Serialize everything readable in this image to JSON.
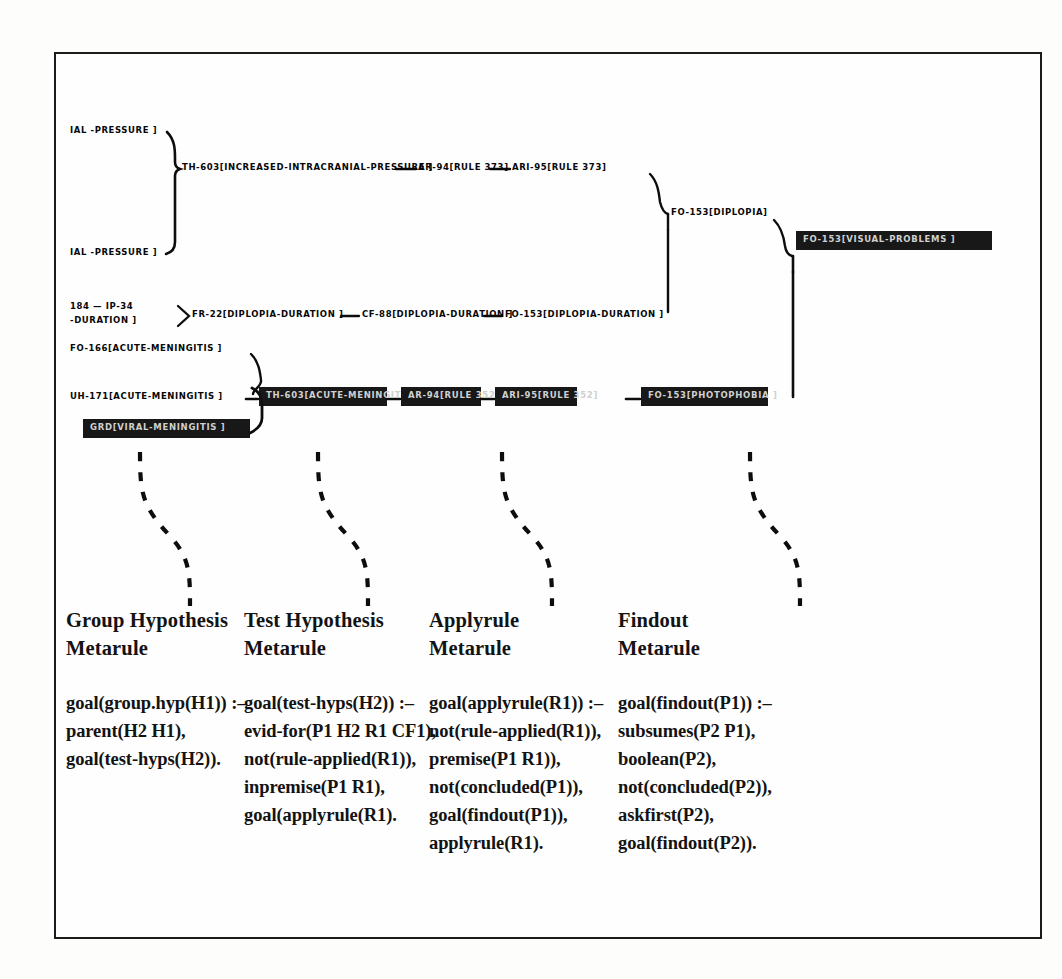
{
  "figure": {
    "kind": "trace-tree-with-metarules",
    "frame_border_color": "#1b1b1b",
    "highlight_color": "#111111",
    "highlight_text_color": "#f2f2f2"
  },
  "trace": {
    "nodes": [
      {
        "id": "n-iap-top",
        "label": "IAL -PRESSURE ]",
        "highlight": false
      },
      {
        "id": "n-iap-bottom",
        "label": "IAL -PRESSURE ]",
        "highlight": false
      },
      {
        "id": "n-th603-icp",
        "label": "TH-603[INCREASED-INTRACRANIAL-PRESSURE ]",
        "highlight": false
      },
      {
        "id": "n-ar94-r373",
        "label": "AR-94[RULE 373]",
        "highlight": false
      },
      {
        "id": "n-ari95-r373",
        "label": "ARI-95[RULE 373]",
        "highlight": false
      },
      {
        "id": "n-fo153-dip",
        "label": "FO-153[DIPLOPIA]",
        "highlight": false
      },
      {
        "id": "n-fo153-vis",
        "label": "FO-153[VISUAL-PROBLEMS ]",
        "highlight": true
      },
      {
        "id": "n-184-ip34",
        "label": "184 — IP-34",
        "highlight": false
      },
      {
        "id": "n-duration",
        "label": "-DURATION ]",
        "highlight": false
      },
      {
        "id": "n-fr22-dd",
        "label": "FR-22[DIPLOPIA-DURATION ]",
        "highlight": false
      },
      {
        "id": "n-cf88-dd",
        "label": "CF-88[DIPLOPIA-DURATION ]",
        "highlight": false
      },
      {
        "id": "n-fo153-dd",
        "label": "FO-153[DIPLOPIA-DURATION ]",
        "highlight": false
      },
      {
        "id": "n-fo166-am",
        "label": "FO-166[ACUTE-MENINGITIS ]",
        "highlight": false
      },
      {
        "id": "n-uh171-am",
        "label": "UH-171[ACUTE-MENINGITIS ]",
        "highlight": false
      },
      {
        "id": "n-th603-am",
        "label": "TH-603[ACUTE-MENINGITIS ]",
        "highlight": true
      },
      {
        "id": "n-ar94-r352",
        "label": "AR-94[RULE 352]",
        "highlight": true
      },
      {
        "id": "n-ari95-r352",
        "label": "ARI-95[RULE 352]",
        "highlight": true
      },
      {
        "id": "n-fo153-photo",
        "label": "FO-153[PHOTOPHOBIA ]",
        "highlight": true
      },
      {
        "id": "n-grd-vm",
        "label": "GRD[VIRAL-MENINGITIS ]",
        "highlight": true
      }
    ]
  },
  "metarules": [
    {
      "title_line1": "Group Hypothesis",
      "title_line2": "Metarule",
      "code": [
        "goal(group.hyp(H1)) :–",
        "parent(H2 H1),",
        "goal(test-hyps(H2))."
      ]
    },
    {
      "title_line1": "Test Hypothesis",
      "title_line2": "Metarule",
      "code": [
        "goal(test-hyps(H2)) :–",
        "evid-for(P1 H2 R1 CF1),",
        "not(rule-applied(R1)),",
        "inpremise(P1 R1),",
        "goal(applyrule(R1)."
      ]
    },
    {
      "title_line1": "Applyrule",
      "title_line2": "Metarule",
      "code": [
        "goal(applyrule(R1)) :–",
        "not(rule-applied(R1)),",
        "premise(P1 R1)),",
        "not(concluded(P1)),",
        "goal(findout(P1)),",
        "applyrule(R1)."
      ]
    },
    {
      "title_line1": "Findout",
      "title_line2": "Metarule",
      "code": [
        "goal(findout(P1)) :–",
        "subsumes(P2 P1),",
        "boolean(P2),",
        "not(concluded(P2)),",
        "askfirst(P2),",
        "goal(findout(P2))."
      ]
    }
  ]
}
